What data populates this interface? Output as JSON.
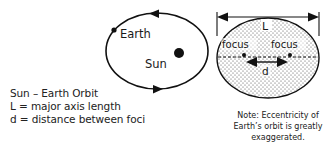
{
  "diagram": {
    "left_orbit": {
      "earth_label": "Earth",
      "sun_label": "Sun",
      "direction": "counterclockwise"
    },
    "right_ellipse": {
      "major_axis_label": "L",
      "focus_label_left": "focus",
      "focus_label_right": "focus",
      "distance_label": "d"
    },
    "legend": {
      "title": "Sun – Earth Orbit",
      "line_L": "L = major axis length",
      "line_d": "d = distance between foci"
    },
    "note": {
      "line1": "Note: Eccentricity of",
      "line2": "Earth’s orbit is greatly",
      "line3": "exaggerated."
    },
    "colors": {
      "stroke": "#111111",
      "background": "#ffffff",
      "text": "#222222"
    }
  }
}
